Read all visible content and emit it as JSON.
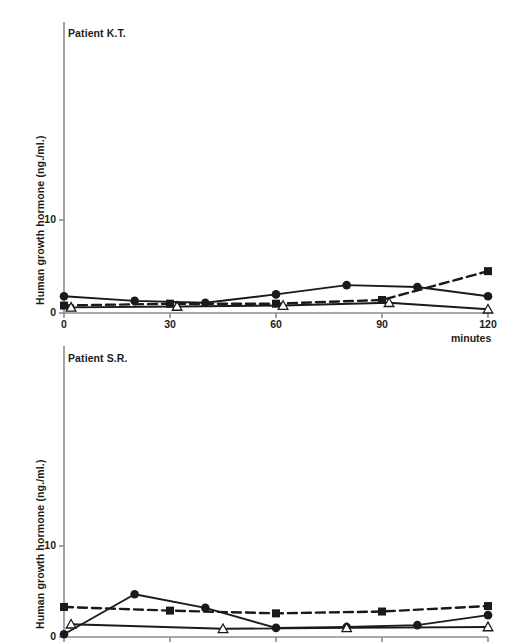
{
  "figure": {
    "panels": [
      {
        "title": "Patient K.T.",
        "ylabel": "Human growth hormone (ng./ml.)",
        "xlabel": "minutes",
        "ytick_0": "0",
        "ytick_10": "10",
        "xticks": [
          "0",
          "30",
          "60",
          "90",
          "120"
        ]
      },
      {
        "title": "Patient S.R.",
        "ylabel": "Human growth hormone (ng./ml.)",
        "xlabel": "minutes",
        "ytick_0": "0",
        "ytick_10": "10",
        "xticks": [
          "0",
          "30",
          "60",
          "90",
          "120"
        ]
      }
    ]
  },
  "chart_data": [
    {
      "type": "line",
      "title": "Patient K.T.",
      "xlabel": "minutes",
      "ylabel": "Human growth hormone (ng./ml.)",
      "xlim": [
        0,
        120
      ],
      "ylim": [
        0,
        17
      ],
      "xticks": [
        0,
        30,
        60,
        90,
        120
      ],
      "yticks": [
        0,
        10
      ],
      "grid": false,
      "legend": "none",
      "series": [
        {
          "name": "circles-solid",
          "marker": "filled-circle",
          "line": "solid",
          "x": [
            0,
            20,
            40,
            60,
            80,
            100,
            120
          ],
          "y": [
            1.8,
            1.3,
            1.1,
            2.0,
            3.0,
            2.8,
            1.8
          ]
        },
        {
          "name": "squares-dashed",
          "marker": "filled-square",
          "line": "dashed",
          "x": [
            0,
            30,
            60,
            90,
            120
          ],
          "y": [
            0.8,
            1.0,
            1.0,
            1.4,
            4.5
          ]
        },
        {
          "name": "triangles-solid",
          "marker": "open-triangle",
          "line": "solid",
          "x": [
            2,
            32,
            62,
            92,
            120
          ],
          "y": [
            0.6,
            0.7,
            0.8,
            1.1,
            0.4
          ]
        }
      ]
    },
    {
      "type": "line",
      "title": "Patient S.R.",
      "xlabel": "minutes",
      "ylabel": "Human growth hormone (ng./ml.)",
      "xlim": [
        0,
        120
      ],
      "ylim": [
        0,
        17
      ],
      "xticks": [
        0,
        30,
        60,
        90,
        120
      ],
      "yticks": [
        0,
        10
      ],
      "grid": false,
      "legend": "none",
      "series": [
        {
          "name": "circles-solid",
          "marker": "filled-circle",
          "line": "solid",
          "x": [
            0,
            20,
            40,
            60,
            80,
            100,
            120
          ],
          "y": [
            0.3,
            4.7,
            3.2,
            1.0,
            1.1,
            1.3,
            2.4
          ]
        },
        {
          "name": "squares-dashed",
          "marker": "filled-square",
          "line": "dashed",
          "x": [
            0,
            30,
            60,
            90,
            120
          ],
          "y": [
            3.3,
            2.9,
            2.6,
            2.8,
            3.4
          ]
        },
        {
          "name": "triangles-solid",
          "marker": "open-triangle",
          "line": "solid",
          "x": [
            2,
            45,
            80,
            120
          ],
          "y": [
            1.4,
            0.9,
            1.0,
            1.1
          ]
        }
      ]
    }
  ],
  "colors": {
    "ink": "#1a1a1a",
    "axis": "#8c8c8c",
    "background": "#ffffff"
  }
}
